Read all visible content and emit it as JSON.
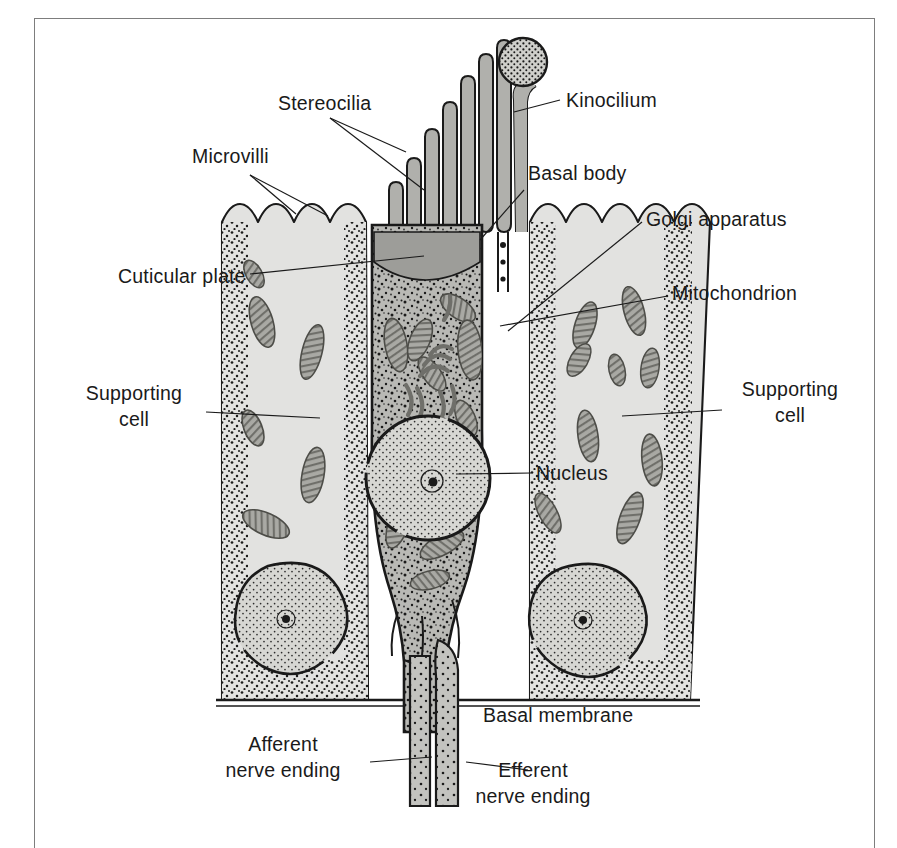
{
  "figure": {
    "kind": "labeled-anatomical-diagram",
    "background_color": "#ffffff",
    "frame_color": "#7d7d7d",
    "ink_color": "#1a1a1a"
  },
  "palette": {
    "supporting_cell_fill": "#e2e2e0",
    "hair_cell_fill": "#b9b9b5",
    "stereocilia_fill": "#b0b0ac",
    "cuticular_plate_fill": "#9d9d99",
    "mitochondrion_fill": "#a9a9a4",
    "nucleus_fill": "#d7d7d3",
    "nerve_fill": "#c3c3bf",
    "stipple_color": "#1a1a1a"
  },
  "labels": [
    {
      "id": "stereocilia",
      "text": "Stereocilia",
      "x": 278,
      "y": 110,
      "anchor": "start",
      "lines": 1
    },
    {
      "id": "kinocilium",
      "text": "Kinocilium",
      "x": 566,
      "y": 107,
      "anchor": "start",
      "lines": 1
    },
    {
      "id": "microvilli",
      "text": "Microvilli",
      "x": 192,
      "y": 163,
      "anchor": "start",
      "lines": 1
    },
    {
      "id": "basal-body",
      "text": "Basal body",
      "x": 528,
      "y": 180,
      "anchor": "start",
      "lines": 1
    },
    {
      "id": "golgi-apparatus",
      "text": "Golgi apparatus",
      "x": 646,
      "y": 226,
      "anchor": "start",
      "lines": 1
    },
    {
      "id": "cuticular-plate",
      "text": "Cuticular plate",
      "x": 118,
      "y": 283,
      "anchor": "start",
      "lines": 1
    },
    {
      "id": "mitochondrion",
      "text": "Mitochondrion",
      "x": 672,
      "y": 300,
      "anchor": "start",
      "lines": 1
    },
    {
      "id": "supporting-cell-left",
      "text": "Supporting cell",
      "line1": "Supporting",
      "line2": "cell",
      "x": 134,
      "y": 400,
      "anchor": "middle",
      "lines": 2
    },
    {
      "id": "supporting-cell-right",
      "text": "Supporting cell",
      "line1": "Supporting",
      "line2": "cell",
      "x": 790,
      "y": 396,
      "anchor": "middle",
      "lines": 2
    },
    {
      "id": "nucleus",
      "text": "Nucleus",
      "x": 536,
      "y": 480,
      "anchor": "start",
      "lines": 1
    },
    {
      "id": "basal-membrane",
      "text": "Basal membrane",
      "x": 483,
      "y": 722,
      "anchor": "start",
      "lines": 1
    },
    {
      "id": "afferent-nerve-ending",
      "text": "Afferent nerve ending",
      "line1": "Afferent",
      "line2": "nerve ending",
      "x": 283,
      "y": 751,
      "anchor": "middle",
      "lines": 2
    },
    {
      "id": "efferent-nerve-ending",
      "text": "Efferent nerve ending",
      "line1": "Efferent",
      "line2": "nerve ending",
      "x": 533,
      "y": 777,
      "anchor": "middle",
      "lines": 2
    }
  ],
  "leader_lines": [
    {
      "id": "stereocilia-leader-1",
      "path": "M 330 118 L 424 190"
    },
    {
      "id": "stereocilia-leader-2",
      "path": "M 330 118 L 409 154"
    },
    {
      "id": "kinocilium-leader",
      "path": "M 560 100 L 512 115"
    },
    {
      "id": "microvilli-leader-1",
      "path": "M 250 175 L 297 216"
    },
    {
      "id": "microvilli-leader-2",
      "path": "M 250 175 L 327 219"
    },
    {
      "id": "basal-body-leader",
      "path": "M 524 190 L 478 240"
    },
    {
      "id": "golgi-leader",
      "path": "M 642 222 L 508 331"
    },
    {
      "id": "cuticular-plate-leader",
      "path": "M 250 274 L 423 257"
    },
    {
      "id": "mitochondrion-leader",
      "path": "M 668 296 L 505 325"
    },
    {
      "id": "supporting-cell-left-leader",
      "path": "M 206 412 L 318 418"
    },
    {
      "id": "supporting-cell-right-leader",
      "path": "M 722 410 L 624 415"
    },
    {
      "id": "nucleus-leader",
      "path": "M 531 473 L 458 474"
    },
    {
      "id": "afferent-leader",
      "path": "M 370 762 L 430 757"
    },
    {
      "id": "efferent-leader",
      "path": "M 528 770 L 468 762"
    }
  ],
  "structures": {
    "supporting_cell_left": {
      "label": "left supporting cell"
    },
    "supporting_cell_right": {
      "label": "right supporting cell"
    },
    "hair_cell": {
      "label": "hair cell body"
    },
    "stereocilia_count": 8,
    "kinocilium_count": 1,
    "microvilli_left_count": 4,
    "microvilli_right_count": 5,
    "supporting_cell_nuclei": 2,
    "hair_cell_nucleus": 1,
    "nerve_endings": 2
  }
}
